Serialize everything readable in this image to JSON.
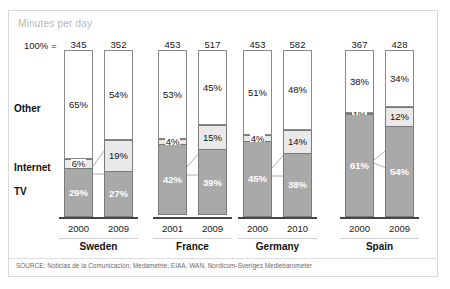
{
  "chart_data": {
    "type": "bar",
    "title": "Minutes per day",
    "subtitle": "",
    "xlabel": "",
    "ylabel": "",
    "ylim": [
      0,
      100
    ],
    "grid": false,
    "legend_position": "left-row-labels",
    "stacked": true,
    "units": "percent",
    "total_prefix": "100% =",
    "categories": [
      "Sweden 2000",
      "Sweden 2009",
      "France 2001",
      "France 2009",
      "Germany 2000",
      "Germany 2010",
      "Spain 2000",
      "Spain 2009"
    ],
    "series": [
      {
        "name": "Other",
        "values": [
          65,
          54,
          53,
          45,
          51,
          48,
          38,
          34
        ]
      },
      {
        "name": "Internet",
        "values": [
          6,
          19,
          4,
          15,
          4,
          14,
          1,
          12
        ]
      },
      {
        "name": "TV",
        "values": [
          29,
          27,
          42,
          39,
          45,
          38,
          61,
          54
        ]
      }
    ],
    "totals": [
      345,
      352,
      453,
      517,
      453,
      582,
      367,
      428
    ],
    "annotations": {
      "source": "SOURCE: Noticias de la Comunicación; Medametrie; EIAA, WAN, Nordicom-Sveriges Mediebarometer"
    }
  },
  "header": {
    "title": "Minutes per day",
    "total_label": "100% ="
  },
  "row_labels": {
    "other": "Other",
    "internet": "Internet",
    "tv": "TV"
  },
  "groups": [
    {
      "country": "Sweden",
      "bars": [
        {
          "year": "2000",
          "total": "345",
          "other": "65%",
          "internet": "6%",
          "tv": "29%"
        },
        {
          "year": "2009",
          "total": "352",
          "other": "54%",
          "internet": "19%",
          "tv": "27%"
        }
      ]
    },
    {
      "country": "France",
      "bars": [
        {
          "year": "2001",
          "total": "453",
          "other": "53%",
          "internet": "4%",
          "tv": "42%"
        },
        {
          "year": "2009",
          "total": "517",
          "other": "45%",
          "internet": "15%",
          "tv": "39%"
        }
      ]
    },
    {
      "country": "Germany",
      "bars": [
        {
          "year": "2000",
          "total": "453",
          "other": "51%",
          "internet": "4%",
          "tv": "45%"
        },
        {
          "year": "2010",
          "total": "582",
          "other": "48%",
          "internet": "14%",
          "tv": "38%"
        }
      ]
    },
    {
      "country": "Spain",
      "bars": [
        {
          "year": "2000",
          "total": "367",
          "other": "38%",
          "internet": "1%",
          "tv": "61%"
        },
        {
          "year": "2009",
          "total": "428",
          "other": "34%",
          "internet": "12%",
          "tv": "54%"
        }
      ]
    }
  ],
  "footer": {
    "source": "SOURCE: Noticias de la Comunicación; Medametrie; EIAA, WAN, Nordicom-Sveriges Mediebarometer"
  },
  "colors": {
    "other_fill": "#ffffff",
    "internet_fill": "#e9e9e9",
    "tv_fill": "#a9a9a9",
    "outline": "#808080",
    "title_gray": "#b8b8b8",
    "baseline": "#444444"
  }
}
